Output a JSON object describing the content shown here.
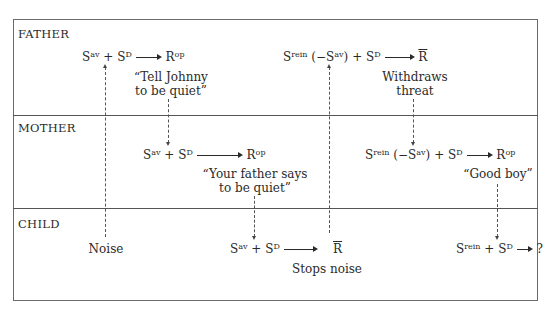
{
  "diagram": {
    "rows": [
      {
        "id": "father",
        "label": "FATHER"
      },
      {
        "id": "mother",
        "label": "MOTHER"
      },
      {
        "id": "child",
        "label": "CHILD"
      }
    ],
    "father": {
      "formula1": {
        "s1": "S",
        "s1_sup": "av",
        "plus": "+",
        "s2": "S",
        "s2_sup": "D",
        "r": "R",
        "r_sup": "op"
      },
      "caption1": {
        "line1": "“Tell Johnny",
        "line2": "to be quiet”"
      },
      "formula2": {
        "s1": "S",
        "s1_sup": "rein",
        "paren_open": "(−S",
        "paren_sup": "av",
        "paren_close": ")",
        "plus": "+",
        "s2": "S",
        "s2_sup": "D",
        "r": "R"
      },
      "caption2": {
        "line1": "Withdraws",
        "line2": "threat"
      }
    },
    "mother": {
      "formula1": {
        "s1": "S",
        "s1_sup": "av",
        "plus": "+",
        "s2": "S",
        "s2_sup": "D",
        "r": "R",
        "r_sup": "op"
      },
      "caption1": {
        "line1": "“Your father says",
        "line2": "to be quiet”"
      },
      "formula2": {
        "s1": "S",
        "s1_sup": "rein",
        "paren_open": "(−S",
        "paren_sup": "av",
        "paren_close": ")",
        "plus": "+",
        "s2": "S",
        "s2_sup": "D",
        "r": "R",
        "r_sup": "op"
      },
      "caption2": {
        "line1": "“Good boy”"
      }
    },
    "child": {
      "noise": "Noise",
      "formula1": {
        "s1": "S",
        "s1_sup": "av",
        "plus": "+",
        "s2": "S",
        "s2_sup": "D",
        "r": "R"
      },
      "caption1": {
        "line1": "Stops noise"
      },
      "formula2": {
        "s1": "S",
        "s1_sup": "rein",
        "plus": "+",
        "s2": "S",
        "s2_sup": "D",
        "r": "?"
      }
    }
  }
}
